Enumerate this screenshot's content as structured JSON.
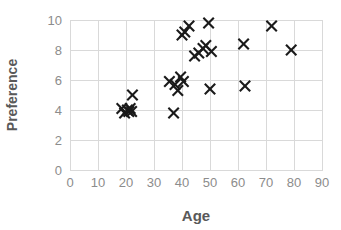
{
  "chart_data": {
    "type": "scatter",
    "title": "",
    "xlabel": "Age",
    "ylabel": "Preference",
    "xlim": [
      0,
      90
    ],
    "ylim": [
      0,
      10
    ],
    "xticks": [
      0,
      10,
      20,
      30,
      40,
      50,
      60,
      70,
      80,
      90
    ],
    "yticks": [
      0,
      2,
      4,
      6,
      8,
      10
    ],
    "xtick_labels": [
      "0",
      "10",
      "20",
      "30",
      "40",
      "50",
      "60",
      "70",
      "80",
      "90"
    ],
    "ytick_labels": [
      "0",
      "2",
      "4",
      "6",
      "8",
      "10"
    ],
    "grid": true,
    "legend": false,
    "marker": "x",
    "marker_color": "#1a1a1a",
    "grid_color": "#d9d9d9",
    "label_color": "#595959",
    "tick_color": "#8c8c8c",
    "points": [
      {
        "x": 18.5,
        "y": 4.1
      },
      {
        "x": 19.5,
        "y": 3.8
      },
      {
        "x": 20.5,
        "y": 4.0
      },
      {
        "x": 21.0,
        "y": 3.9
      },
      {
        "x": 21.5,
        "y": 4.1
      },
      {
        "x": 22.0,
        "y": 3.9
      },
      {
        "x": 22.3,
        "y": 5.0
      },
      {
        "x": 35.5,
        "y": 5.9
      },
      {
        "x": 37.0,
        "y": 3.8
      },
      {
        "x": 37.5,
        "y": 5.7
      },
      {
        "x": 38.5,
        "y": 5.3
      },
      {
        "x": 39.5,
        "y": 6.2
      },
      {
        "x": 40.0,
        "y": 9.0
      },
      {
        "x": 40.5,
        "y": 5.9
      },
      {
        "x": 41.0,
        "y": 9.2
      },
      {
        "x": 42.5,
        "y": 9.6
      },
      {
        "x": 44.5,
        "y": 7.6
      },
      {
        "x": 46.0,
        "y": 7.8
      },
      {
        "x": 47.5,
        "y": 8.1
      },
      {
        "x": 48.5,
        "y": 8.3
      },
      {
        "x": 49.5,
        "y": 9.8
      },
      {
        "x": 50.5,
        "y": 7.9
      },
      {
        "x": 50.0,
        "y": 5.4
      },
      {
        "x": 62.0,
        "y": 8.4
      },
      {
        "x": 62.5,
        "y": 5.6
      },
      {
        "x": 72.0,
        "y": 9.6
      },
      {
        "x": 79.0,
        "y": 8.0
      }
    ]
  },
  "geometry": {
    "plot_left": 70,
    "plot_right": 322,
    "plot_top": 20,
    "plot_bottom": 170
  }
}
